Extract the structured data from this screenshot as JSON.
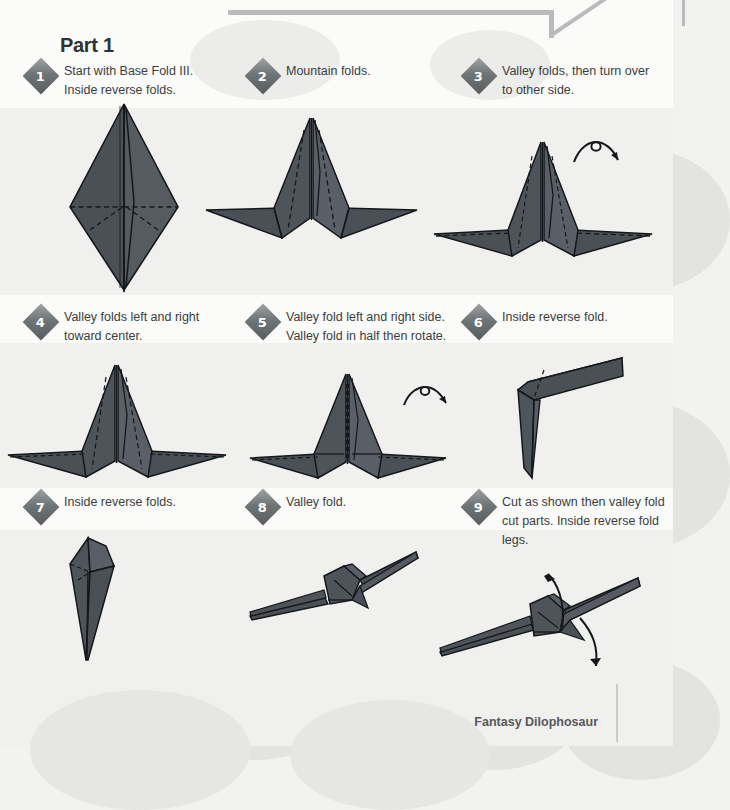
{
  "document": {
    "part_title": "Part 1",
    "footer_caption": "Fantasy Dilophosaur"
  },
  "colors": {
    "paper_fill": "#4b5057",
    "paper_fill_light": "#5b6068",
    "paper_outline": "#15181b",
    "fold_line": "#15181b",
    "badge_dark": "#585d60",
    "badge_light": "#9fa3a4",
    "text": "#3a3e41",
    "background": "#f4f4f2",
    "blotch": "#e3e4e2",
    "rule": "#b9bcbb"
  },
  "steps": [
    {
      "number": "1",
      "text": "Start with Base Fold III. Inside reverse folds.",
      "figure_name": "tall-diamond-kite",
      "has_turnover_arrow": false
    },
    {
      "number": "2",
      "text": "Mountain folds.",
      "figure_name": "winged-peak-form",
      "has_turnover_arrow": false
    },
    {
      "number": "3",
      "text": "Valley folds, then turn over to other side.",
      "figure_name": "winged-peak-form-valley",
      "has_turnover_arrow": true
    },
    {
      "number": "4",
      "text": "Valley folds left and right toward center.",
      "figure_name": "winged-peak-form-narrow",
      "has_turnover_arrow": false
    },
    {
      "number": "5",
      "text": "Valley fold left and right side. Valley fold in half then rotate.",
      "figure_name": "winged-peak-creased",
      "has_turnover_arrow": true
    },
    {
      "number": "6",
      "text": "Inside reverse fold.",
      "figure_name": "bent-l-form",
      "has_turnover_arrow": false
    },
    {
      "number": "7",
      "text": "Inside reverse folds.",
      "figure_name": "narrow-spike-form",
      "has_turnover_arrow": false
    },
    {
      "number": "8",
      "text": "Valley fold.",
      "figure_name": "flat-dinosaur-profile",
      "has_turnover_arrow": false
    },
    {
      "number": "9",
      "text": "Cut as shown then valley fold cut parts. Inside reverse fold legs.",
      "figure_name": "dinosaur-with-cut-arrows",
      "has_turnover_arrow": false
    }
  ],
  "icons": {
    "turnover_arrow": "turnover-arrow-icon",
    "curved_arrow_up": "curved-arrow-up-icon",
    "curved_arrow_down": "curved-arrow-down-icon"
  }
}
